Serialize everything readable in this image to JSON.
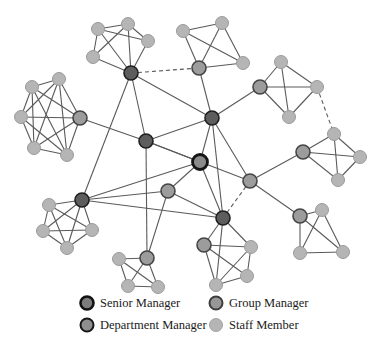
{
  "figure": {
    "width": 386,
    "height": 356,
    "background": "#ffffff",
    "kind": "organizational-network-diagram"
  },
  "legend": {
    "items": [
      {
        "id": "senior-manager",
        "label": "Senior Manager",
        "marker": {
          "x": 87,
          "y": 303,
          "r": 6.5,
          "fill": "#7d7d7d",
          "stroke": "#121212",
          "stroke_width": 2.6
        },
        "label_x": 100,
        "label_y": 307
      },
      {
        "id": "group-manager",
        "label": "Group Manager",
        "marker": {
          "x": 216,
          "y": 303,
          "r": 6.5,
          "fill": "#989898",
          "stroke": "#3d3d3d",
          "stroke_width": 2.0
        },
        "label_x": 229,
        "label_y": 307
      },
      {
        "id": "department-manager",
        "label": "Department Manager",
        "marker": {
          "x": 87,
          "y": 325,
          "r": 6.5,
          "fill": "#8f8f8f",
          "stroke": "#161616",
          "stroke_width": 2.0
        },
        "label_x": 100,
        "label_y": 329
      },
      {
        "id": "staff-member",
        "label": "Staff Member",
        "marker": {
          "x": 216,
          "y": 325,
          "r": 6.5,
          "fill": "#b5b5b5",
          "stroke": "#a2a2a2",
          "stroke_width": 1.0
        },
        "label_x": 229,
        "label_y": 329
      }
    ]
  },
  "styles": {
    "node_types": {
      "senior_manager": {
        "fill": "#8a8a8a",
        "stroke": "#141414",
        "stroke_width": 2.8,
        "r": 7.5
      },
      "department_manager": {
        "fill": "#5d5d5d",
        "stroke": "#1f1f1f",
        "stroke_width": 1.6,
        "r": 7.0
      },
      "group_manager": {
        "fill": "#9c9c9c",
        "stroke": "#454545",
        "stroke_width": 1.6,
        "r": 7.0
      },
      "staff_member": {
        "fill": "#b5b5b5",
        "stroke": "#9b9b9b",
        "stroke_width": 1.0,
        "r": 6.5
      }
    },
    "edge": {
      "stroke": "#5a5a5a",
      "stroke_width": 1.1,
      "dash": "4 3"
    }
  },
  "network": {
    "nodes": [
      {
        "id": "s1",
        "type": "senior_manager",
        "x": 200,
        "y": 162
      },
      {
        "id": "d1",
        "type": "department_manager",
        "x": 131,
        "y": 73
      },
      {
        "id": "d2",
        "type": "department_manager",
        "x": 146,
        "y": 141
      },
      {
        "id": "d3",
        "type": "department_manager",
        "x": 212,
        "y": 118
      },
      {
        "id": "d4",
        "type": "department_manager",
        "x": 82,
        "y": 200
      },
      {
        "id": "d5",
        "type": "department_manager",
        "x": 223,
        "y": 218
      },
      {
        "id": "g1",
        "type": "group_manager",
        "x": 80,
        "y": 118
      },
      {
        "id": "g2",
        "type": "group_manager",
        "x": 199,
        "y": 68
      },
      {
        "id": "g3",
        "type": "group_manager",
        "x": 260,
        "y": 87
      },
      {
        "id": "g4",
        "type": "group_manager",
        "x": 303,
        "y": 152
      },
      {
        "id": "g5",
        "type": "group_manager",
        "x": 300,
        "y": 216
      },
      {
        "id": "g6",
        "type": "group_manager",
        "x": 204,
        "y": 245
      },
      {
        "id": "g7",
        "type": "group_manager",
        "x": 147,
        "y": 258
      },
      {
        "id": "g8",
        "type": "group_manager",
        "x": 250,
        "y": 181
      },
      {
        "id": "g9",
        "type": "group_manager",
        "x": 168,
        "y": 191
      },
      {
        "id": "a1",
        "type": "staff_member",
        "x": 98,
        "y": 29
      },
      {
        "id": "a2",
        "type": "staff_member",
        "x": 128,
        "y": 24
      },
      {
        "id": "a3",
        "type": "staff_member",
        "x": 148,
        "y": 41
      },
      {
        "id": "a4",
        "type": "staff_member",
        "x": 93,
        "y": 57
      },
      {
        "id": "b1",
        "type": "staff_member",
        "x": 32,
        "y": 87
      },
      {
        "id": "b2",
        "type": "staff_member",
        "x": 59,
        "y": 79
      },
      {
        "id": "b3",
        "type": "staff_member",
        "x": 21,
        "y": 117
      },
      {
        "id": "b4",
        "type": "staff_member",
        "x": 34,
        "y": 148
      },
      {
        "id": "b5",
        "type": "staff_member",
        "x": 67,
        "y": 155
      },
      {
        "id": "c1",
        "type": "staff_member",
        "x": 183,
        "y": 31
      },
      {
        "id": "c2",
        "type": "staff_member",
        "x": 222,
        "y": 23
      },
      {
        "id": "c3",
        "type": "staff_member",
        "x": 243,
        "y": 63
      },
      {
        "id": "e1",
        "type": "staff_member",
        "x": 281,
        "y": 62
      },
      {
        "id": "e2",
        "type": "staff_member",
        "x": 317,
        "y": 87
      },
      {
        "id": "e3",
        "type": "staff_member",
        "x": 289,
        "y": 117
      },
      {
        "id": "f1",
        "type": "staff_member",
        "x": 334,
        "y": 134
      },
      {
        "id": "f2",
        "type": "staff_member",
        "x": 360,
        "y": 157
      },
      {
        "id": "f3",
        "type": "staff_member",
        "x": 338,
        "y": 180
      },
      {
        "id": "h1",
        "type": "staff_member",
        "x": 322,
        "y": 210
      },
      {
        "id": "h2",
        "type": "staff_member",
        "x": 300,
        "y": 253
      },
      {
        "id": "h3",
        "type": "staff_member",
        "x": 343,
        "y": 252
      },
      {
        "id": "i1",
        "type": "staff_member",
        "x": 251,
        "y": 247
      },
      {
        "id": "i2",
        "type": "staff_member",
        "x": 247,
        "y": 276
      },
      {
        "id": "i3",
        "type": "staff_member",
        "x": 216,
        "y": 285
      },
      {
        "id": "j1",
        "type": "staff_member",
        "x": 119,
        "y": 259
      },
      {
        "id": "j2",
        "type": "staff_member",
        "x": 128,
        "y": 286
      },
      {
        "id": "j3",
        "type": "staff_member",
        "x": 158,
        "y": 287
      },
      {
        "id": "k1",
        "type": "staff_member",
        "x": 49,
        "y": 205
      },
      {
        "id": "k2",
        "type": "staff_member",
        "x": 43,
        "y": 231
      },
      {
        "id": "k3",
        "type": "staff_member",
        "x": 92,
        "y": 230
      },
      {
        "id": "k4",
        "type": "staff_member",
        "x": 67,
        "y": 248
      }
    ],
    "edges": [
      {
        "from": "a1",
        "to": "a2",
        "style": "solid"
      },
      {
        "from": "a2",
        "to": "a3",
        "style": "solid"
      },
      {
        "from": "a1",
        "to": "a4",
        "style": "solid"
      },
      {
        "from": "a1",
        "to": "a3",
        "style": "solid"
      },
      {
        "from": "a2",
        "to": "a4",
        "style": "solid"
      },
      {
        "from": "a1",
        "to": "d1",
        "style": "solid"
      },
      {
        "from": "a2",
        "to": "d1",
        "style": "solid"
      },
      {
        "from": "a3",
        "to": "d1",
        "style": "solid"
      },
      {
        "from": "a4",
        "to": "d1",
        "style": "solid"
      },
      {
        "from": "b1",
        "to": "b2",
        "style": "solid"
      },
      {
        "from": "b1",
        "to": "b3",
        "style": "solid"
      },
      {
        "from": "b1",
        "to": "b4",
        "style": "solid"
      },
      {
        "from": "b1",
        "to": "b5",
        "style": "solid"
      },
      {
        "from": "b2",
        "to": "b3",
        "style": "solid"
      },
      {
        "from": "b2",
        "to": "b4",
        "style": "solid"
      },
      {
        "from": "b2",
        "to": "b5",
        "style": "solid"
      },
      {
        "from": "b3",
        "to": "b4",
        "style": "solid"
      },
      {
        "from": "b3",
        "to": "b5",
        "style": "solid"
      },
      {
        "from": "b4",
        "to": "b5",
        "style": "solid"
      },
      {
        "from": "b1",
        "to": "g1",
        "style": "solid"
      },
      {
        "from": "b2",
        "to": "g1",
        "style": "solid"
      },
      {
        "from": "b3",
        "to": "g1",
        "style": "solid"
      },
      {
        "from": "b4",
        "to": "g1",
        "style": "solid"
      },
      {
        "from": "b5",
        "to": "g1",
        "style": "solid"
      },
      {
        "from": "c1",
        "to": "c2",
        "style": "solid"
      },
      {
        "from": "c2",
        "to": "c3",
        "style": "solid"
      },
      {
        "from": "c1",
        "to": "c3",
        "style": "solid"
      },
      {
        "from": "c1",
        "to": "g2",
        "style": "solid"
      },
      {
        "from": "c2",
        "to": "g2",
        "style": "solid"
      },
      {
        "from": "c3",
        "to": "g2",
        "style": "solid"
      },
      {
        "from": "e1",
        "to": "e2",
        "style": "solid"
      },
      {
        "from": "e2",
        "to": "e3",
        "style": "solid"
      },
      {
        "from": "e1",
        "to": "e3",
        "style": "solid"
      },
      {
        "from": "e1",
        "to": "g3",
        "style": "solid"
      },
      {
        "from": "e2",
        "to": "g3",
        "style": "solid"
      },
      {
        "from": "e3",
        "to": "g3",
        "style": "solid"
      },
      {
        "from": "f1",
        "to": "f2",
        "style": "solid"
      },
      {
        "from": "f2",
        "to": "f3",
        "style": "solid"
      },
      {
        "from": "f1",
        "to": "f3",
        "style": "solid"
      },
      {
        "from": "f1",
        "to": "g4",
        "style": "solid"
      },
      {
        "from": "f2",
        "to": "g4",
        "style": "solid"
      },
      {
        "from": "f3",
        "to": "g4",
        "style": "solid"
      },
      {
        "from": "h1",
        "to": "h2",
        "style": "solid"
      },
      {
        "from": "h1",
        "to": "h3",
        "style": "solid"
      },
      {
        "from": "h2",
        "to": "h3",
        "style": "solid"
      },
      {
        "from": "h1",
        "to": "g5",
        "style": "solid"
      },
      {
        "from": "h2",
        "to": "g5",
        "style": "solid"
      },
      {
        "from": "h3",
        "to": "g5",
        "style": "solid"
      },
      {
        "from": "i1",
        "to": "i2",
        "style": "solid"
      },
      {
        "from": "i1",
        "to": "i3",
        "style": "solid"
      },
      {
        "from": "i2",
        "to": "i3",
        "style": "solid"
      },
      {
        "from": "i1",
        "to": "g6",
        "style": "solid"
      },
      {
        "from": "i2",
        "to": "g6",
        "style": "solid"
      },
      {
        "from": "i3",
        "to": "g6",
        "style": "solid"
      },
      {
        "from": "j1",
        "to": "j2",
        "style": "solid"
      },
      {
        "from": "j1",
        "to": "j3",
        "style": "solid"
      },
      {
        "from": "j2",
        "to": "j3",
        "style": "solid"
      },
      {
        "from": "j1",
        "to": "g7",
        "style": "solid"
      },
      {
        "from": "j2",
        "to": "g7",
        "style": "solid"
      },
      {
        "from": "j3",
        "to": "g7",
        "style": "solid"
      },
      {
        "from": "k1",
        "to": "k2",
        "style": "solid"
      },
      {
        "from": "k1",
        "to": "k3",
        "style": "solid"
      },
      {
        "from": "k1",
        "to": "k4",
        "style": "solid"
      },
      {
        "from": "k2",
        "to": "k3",
        "style": "solid"
      },
      {
        "from": "k2",
        "to": "k4",
        "style": "solid"
      },
      {
        "from": "k3",
        "to": "k4",
        "style": "solid"
      },
      {
        "from": "k1",
        "to": "d4",
        "style": "solid"
      },
      {
        "from": "k2",
        "to": "d4",
        "style": "solid"
      },
      {
        "from": "k3",
        "to": "d4",
        "style": "solid"
      },
      {
        "from": "k4",
        "to": "d4",
        "style": "solid"
      },
      {
        "from": "d1",
        "to": "d2",
        "style": "solid"
      },
      {
        "from": "d1",
        "to": "d3",
        "style": "solid"
      },
      {
        "from": "d1",
        "to": "d4",
        "style": "solid"
      },
      {
        "from": "g1",
        "to": "d2",
        "style": "solid"
      },
      {
        "from": "g2",
        "to": "d3",
        "style": "solid"
      },
      {
        "from": "g3",
        "to": "d3",
        "style": "solid"
      },
      {
        "from": "d2",
        "to": "d3",
        "style": "solid"
      },
      {
        "from": "d2",
        "to": "s1",
        "style": "solid"
      },
      {
        "from": "d3",
        "to": "s1",
        "style": "solid"
      },
      {
        "from": "d2",
        "to": "g8",
        "style": "solid"
      },
      {
        "from": "d3",
        "to": "g8",
        "style": "solid"
      },
      {
        "from": "d3",
        "to": "d5",
        "style": "solid"
      },
      {
        "from": "g4",
        "to": "g8",
        "style": "solid"
      },
      {
        "from": "g5",
        "to": "g8",
        "style": "solid"
      },
      {
        "from": "s1",
        "to": "g9",
        "style": "solid"
      },
      {
        "from": "s1",
        "to": "d4",
        "style": "solid"
      },
      {
        "from": "s1",
        "to": "d5",
        "style": "solid"
      },
      {
        "from": "g9",
        "to": "d4",
        "style": "solid"
      },
      {
        "from": "g9",
        "to": "g7",
        "style": "solid"
      },
      {
        "from": "g9",
        "to": "d5",
        "style": "solid"
      },
      {
        "from": "d4",
        "to": "d5",
        "style": "solid"
      },
      {
        "from": "d2",
        "to": "g7",
        "style": "solid"
      },
      {
        "from": "d5",
        "to": "g6",
        "style": "solid"
      },
      {
        "from": "d5",
        "to": "i1",
        "style": "solid"
      },
      {
        "from": "d5",
        "to": "i3",
        "style": "solid"
      },
      {
        "from": "d1",
        "to": "g2",
        "style": "dashed"
      },
      {
        "from": "e2",
        "to": "f1",
        "style": "dashed"
      },
      {
        "from": "g8",
        "to": "d5",
        "style": "dashed"
      }
    ]
  }
}
